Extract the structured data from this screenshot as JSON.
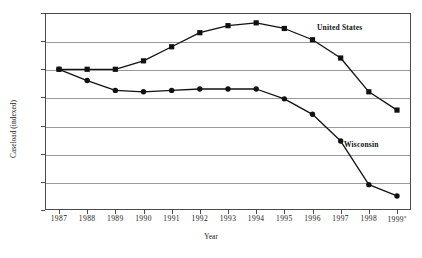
{
  "chart_data": {
    "type": "line",
    "title": "",
    "xlabel": "Year",
    "ylabel": "Caseload (indexed)",
    "x": [
      "1987",
      "1988",
      "1989",
      "1990",
      "1991",
      "1992",
      "1993",
      "1994",
      "1995",
      "1996",
      "1997",
      "1998",
      "1999"
    ],
    "x_tick_labels": [
      "1987",
      "1988",
      "1989",
      "1990",
      "1991",
      "1992",
      "1993",
      "1994",
      "1995",
      "1996",
      "1997",
      "1998",
      "1999"
    ],
    "x_last_label_superscript": "a",
    "y_tick_labels": [
      "0",
      "0.2",
      "0.4",
      "0.6",
      "0.8",
      "1",
      "1.2",
      "1.4"
    ],
    "y_tick_values": [
      0,
      0.2,
      0.4,
      0.6,
      0.8,
      1.0,
      1.2,
      1.4
    ],
    "ylim": [
      0,
      1.4
    ],
    "grid": true,
    "legend_position": "inline-annotation",
    "series": [
      {
        "name": "United States",
        "marker": "square",
        "color": "#111111",
        "values": [
          1.0,
          1.0,
          1.0,
          1.06,
          1.16,
          1.26,
          1.31,
          1.33,
          1.29,
          1.21,
          1.08,
          0.84,
          0.71
        ]
      },
      {
        "name": "Wisconsin",
        "marker": "circle",
        "color": "#111111",
        "values": [
          1.0,
          0.92,
          0.85,
          0.84,
          0.85,
          0.86,
          0.86,
          0.86,
          0.79,
          0.68,
          0.49,
          0.18,
          0.1
        ]
      }
    ],
    "annotations": [
      {
        "text": "United States",
        "series": "United States"
      },
      {
        "text": "Wisconsin",
        "series": "Wisconsin"
      }
    ]
  },
  "axes": {
    "y_axis_title": "Caseload (indexed)",
    "x_axis_title": "Year"
  },
  "colors": {
    "line": "#111111",
    "grid": "#9a9a9a",
    "frame": "#4a4a4a",
    "text": "#1a1a1a",
    "background": "#ffffff"
  }
}
